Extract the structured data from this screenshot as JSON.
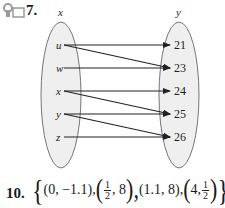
{
  "problem_7": {
    "number": "7.",
    "domain_label": "x",
    "range_label": "y",
    "domain": [
      "u",
      "w",
      "x",
      "y",
      "z"
    ],
    "range": [
      "21",
      "23",
      "24",
      "25",
      "26"
    ],
    "mappings": [
      [
        "u",
        "21"
      ],
      [
        "u",
        "23"
      ],
      [
        "w",
        "23"
      ],
      [
        "x",
        "24"
      ],
      [
        "x",
        "25"
      ],
      [
        "y",
        "25"
      ],
      [
        "y",
        "26"
      ],
      [
        "z",
        "26"
      ]
    ]
  },
  "problem_10": {
    "number": "10.",
    "open_brace": "{",
    "close_brace": "}",
    "p1": "(0, −1.1),",
    "p2_open": "(",
    "p2_frac_num": "1",
    "p2_frac_den": "2",
    "p2_rest": ", 8",
    "p2_close": "),",
    "p3": "(1.1, 8),",
    "p4_open": "(",
    "p4_first": "4, ",
    "p4_frac_num": "1",
    "p4_frac_den": "2",
    "p4_close": ")"
  },
  "icons": {
    "header": "key-and-box-icon"
  },
  "colors": {
    "ellipse_fill": "#efefef",
    "stroke": "#222222",
    "icon": "#9a9a9a"
  }
}
